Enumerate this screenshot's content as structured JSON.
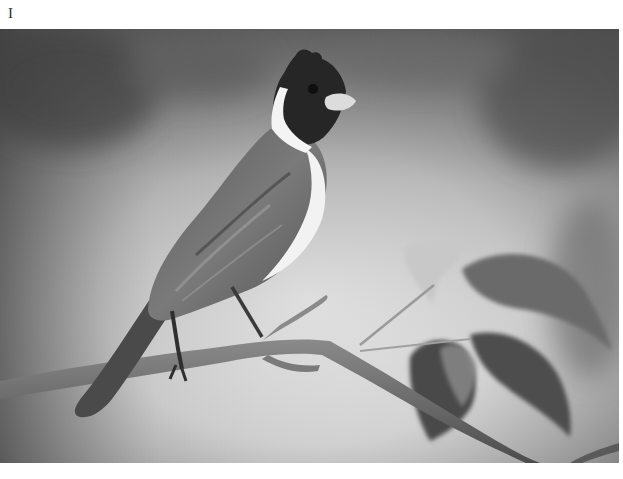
{
  "figure": {
    "label": "I",
    "photo": {
      "subject": "bird perched on branch",
      "description": "Grayscale photograph of a crested bird with dark head, white collar and pale bill, perched on a diagonal twig beside leaves",
      "colors": {
        "background_light": "#d9d9d9",
        "background_dark": "#5a5a5a",
        "bird_head": "#262626",
        "bird_body": "#6b6b6b",
        "collar": "#f2f2f2",
        "branch": "#707070",
        "leaf_dark": "#4a4a4a",
        "leaf_light": "#bdbdbd"
      }
    }
  }
}
